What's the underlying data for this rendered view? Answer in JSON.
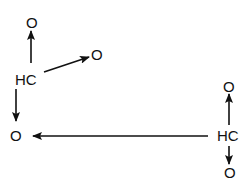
{
  "diagram": {
    "colors": {
      "ink": "#111111",
      "background": "#ffffff"
    },
    "left_group": {
      "center": {
        "label": "HC",
        "x": 28,
        "y": 85
      },
      "top_o": {
        "label": "O",
        "x": 31,
        "y": 28
      },
      "right_o": {
        "label": "O",
        "x": 97,
        "y": 60
      },
      "bottom_o": {
        "label": "O",
        "x": 16,
        "y": 141
      }
    },
    "right_group": {
      "center": {
        "label": "HC",
        "x": 230,
        "y": 141
      },
      "top_o": {
        "label": "O",
        "x": 228,
        "y": 92
      },
      "bottom_o": {
        "label": "O",
        "x": 229,
        "y": 178
      }
    },
    "arrows": [
      {
        "from": "left HC",
        "to": "top O",
        "x1": 31,
        "y1": 63,
        "x2": 31,
        "y2": 31
      },
      {
        "from": "left HC",
        "to": "right O",
        "x1": 44,
        "y1": 72,
        "x2": 89,
        "y2": 57
      },
      {
        "from": "left HC",
        "to": "bottom O",
        "x1": 16,
        "y1": 89,
        "x2": 16,
        "y2": 121
      },
      {
        "from": "right HC",
        "to": "left bottom O",
        "x1": 208,
        "y1": 136,
        "x2": 33,
        "y2": 136
      },
      {
        "from": "right HC",
        "to": "top O",
        "x1": 229,
        "y1": 125,
        "x2": 229,
        "y2": 94
      },
      {
        "from": "right HC",
        "to": "bottom O",
        "x1": 229,
        "y1": 146,
        "x2": 229,
        "y2": 164
      }
    ]
  }
}
